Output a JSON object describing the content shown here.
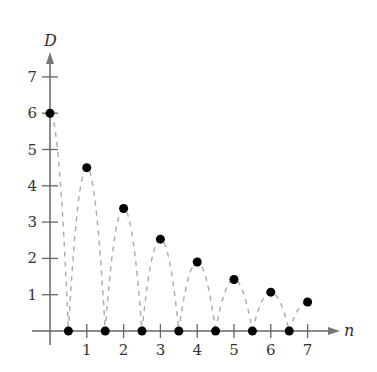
{
  "chart_data": {
    "type": "scatter",
    "title": "",
    "xlabel": "n",
    "ylabel": "D",
    "xlim": [
      0,
      7
    ],
    "ylim": [
      0,
      7
    ],
    "x_ticks": [
      1,
      2,
      3,
      4,
      5,
      6,
      7
    ],
    "y_ticks": [
      1,
      2,
      3,
      4,
      5,
      6,
      7
    ],
    "grid": false,
    "legend": null,
    "series": [
      {
        "name": "peak heights",
        "marker": "filled-circle",
        "x": [
          0,
          1,
          2,
          3,
          4,
          5,
          6,
          7
        ],
        "values": [
          6,
          4.5,
          3.375,
          2.53,
          1.9,
          1.42,
          1.07,
          0.8
        ]
      },
      {
        "name": "bounce points",
        "marker": "filled-circle",
        "x": [
          0.5,
          1.5,
          2.5,
          3.5,
          4.5,
          5.5,
          6.5
        ],
        "values": [
          0,
          0,
          0,
          0,
          0,
          0,
          0
        ]
      }
    ],
    "annotations": [
      "dashed parabolic arcs connecting bounce points through peaks"
    ]
  },
  "colors": {
    "axis": "#666666",
    "points": "#000000",
    "dashes": "#aaaaaa",
    "text": "#333333"
  }
}
